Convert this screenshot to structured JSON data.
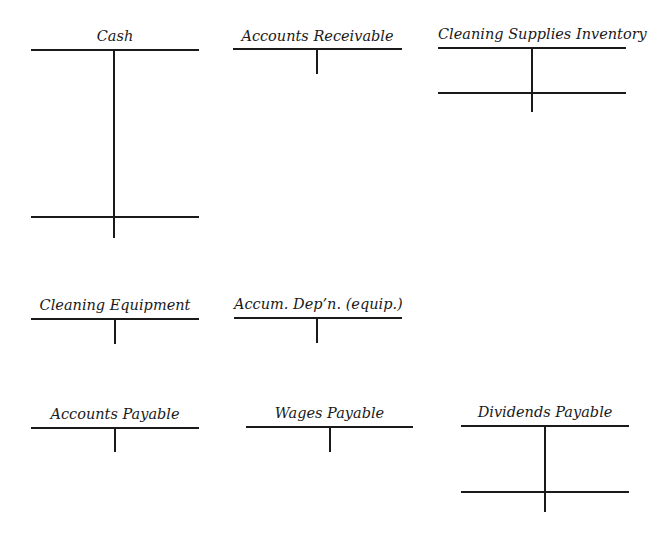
{
  "diagram": {
    "type": "t-accounts",
    "line_color": "#1a1a1a",
    "accounts": [
      {
        "name": "Cash",
        "debit_entries": [],
        "credit_entries": [],
        "has_balance_line": true
      },
      {
        "name": "Accounts Receivable",
        "debit_entries": [],
        "credit_entries": [],
        "has_balance_line": false
      },
      {
        "name": "Cleaning Supplies Inventory",
        "debit_entries": [],
        "credit_entries": [],
        "has_balance_line": true
      },
      {
        "name": "Cleaning Equipment",
        "debit_entries": [],
        "credit_entries": [],
        "has_balance_line": false
      },
      {
        "name": "Accum. Dep’n. (equip.)",
        "debit_entries": [],
        "credit_entries": [],
        "has_balance_line": false
      },
      {
        "name": "Accounts Payable",
        "debit_entries": [],
        "credit_entries": [],
        "has_balance_line": false
      },
      {
        "name": "Wages Payable",
        "debit_entries": [],
        "credit_entries": [],
        "has_balance_line": false
      },
      {
        "name": "Dividends Payable",
        "debit_entries": [],
        "credit_entries": [],
        "has_balance_line": true
      }
    ]
  }
}
